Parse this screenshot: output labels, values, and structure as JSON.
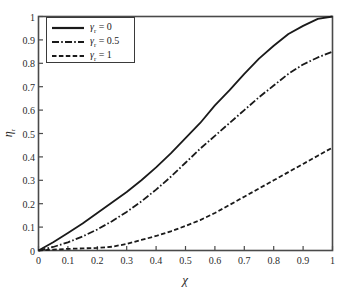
{
  "chart_data": {
    "type": "line",
    "title": "",
    "xlabel": "χ",
    "ylabel": "ηᵣ",
    "ylabel_base": "η",
    "ylabel_sub": "r",
    "xlim": [
      0,
      1
    ],
    "ylim": [
      0,
      1
    ],
    "grid": false,
    "legend_position": "top-left",
    "xticks": [
      "0",
      "0.1",
      "0.2",
      "0.3",
      "0.4",
      "0.5",
      "0.6",
      "0.7",
      "0.8",
      "0.9",
      "1"
    ],
    "xtick_values": [
      0,
      0.1,
      0.2,
      0.3,
      0.4,
      0.5,
      0.6,
      0.7,
      0.8,
      0.9,
      1
    ],
    "yticks": [
      "0",
      "0.1",
      "0.2",
      "0.3",
      "0.4",
      "0.5",
      "0.6",
      "0.7",
      "0.8",
      "0.9",
      "1"
    ],
    "ytick_values": [
      0,
      0.1,
      0.2,
      0.3,
      0.4,
      0.5,
      0.6,
      0.7,
      0.8,
      0.9,
      1
    ],
    "x": [
      0,
      0.05,
      0.1,
      0.15,
      0.2,
      0.25,
      0.3,
      0.35,
      0.4,
      0.45,
      0.5,
      0.55,
      0.6,
      0.65,
      0.7,
      0.75,
      0.8,
      0.85,
      0.9,
      0.95,
      1
    ],
    "series": [
      {
        "name": "γᵣ = 0",
        "symbol_base": "γ",
        "symbol_sub": "r",
        "value_label": "0",
        "style": "solid",
        "color": "#1a1a1a",
        "values": [
          0,
          0.035,
          0.075,
          0.115,
          0.16,
          0.205,
          0.25,
          0.3,
          0.355,
          0.415,
          0.48,
          0.545,
          0.62,
          0.685,
          0.755,
          0.82,
          0.875,
          0.925,
          0.96,
          0.99,
          1.0
        ]
      },
      {
        "name": "γᵣ = 0.5",
        "symbol_base": "γ",
        "symbol_sub": "r",
        "value_label": "0.5",
        "style": "dashdot",
        "color": "#1a1a1a",
        "values": [
          0,
          0.015,
          0.035,
          0.06,
          0.09,
          0.125,
          0.165,
          0.21,
          0.26,
          0.315,
          0.375,
          0.435,
          0.49,
          0.545,
          0.6,
          0.655,
          0.705,
          0.755,
          0.795,
          0.825,
          0.85
        ]
      },
      {
        "name": "γᵣ = 1",
        "symbol_base": "γ",
        "symbol_sub": "r",
        "value_label": "1",
        "style": "dashed",
        "color": "#1a1a1a",
        "values": [
          0,
          0.004,
          0.007,
          0.009,
          0.011,
          0.016,
          0.028,
          0.045,
          0.062,
          0.082,
          0.105,
          0.13,
          0.16,
          0.195,
          0.23,
          0.265,
          0.3,
          0.335,
          0.37,
          0.405,
          0.44
        ]
      }
    ]
  },
  "axes": {
    "frame_color": "#4a4a4a",
    "tick_color": "#4a4a4a"
  }
}
